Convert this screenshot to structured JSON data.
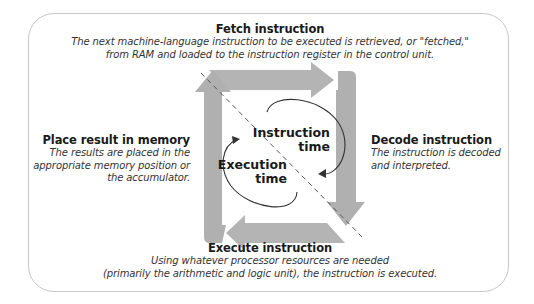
{
  "diagram": {
    "steps": [
      {
        "id": "fetch",
        "title": "Fetch instruction",
        "description_lines": [
          "The next machine-language instruction to be executed is retrieved, or \"fetched,\"",
          "from RAM and loaded to the instruction register in the control unit."
        ]
      },
      {
        "id": "decode",
        "title": "Decode instruction",
        "description_lines": [
          "The instruction is decoded",
          "and interpreted."
        ]
      },
      {
        "id": "execute",
        "title": "Execute instruction",
        "description_lines": [
          "Using whatever processor resources are needed",
          "(primarily the arithmetic and logic unit), the instruction is executed."
        ]
      },
      {
        "id": "place",
        "title": "Place result in memory",
        "description_lines": [
          "The results are placed in the",
          "appropriate memory position or",
          "the accumulator."
        ]
      }
    ],
    "phases": {
      "instruction_time": [
        "Instruction",
        "time"
      ],
      "execution_time": [
        "Execution",
        "time"
      ]
    },
    "colors": {
      "arrow": "#b4b4b4",
      "arrow_dark": "#a0a0a0",
      "frame": "#c8c8c8",
      "dash": "#555555",
      "curve": "#333333"
    }
  }
}
